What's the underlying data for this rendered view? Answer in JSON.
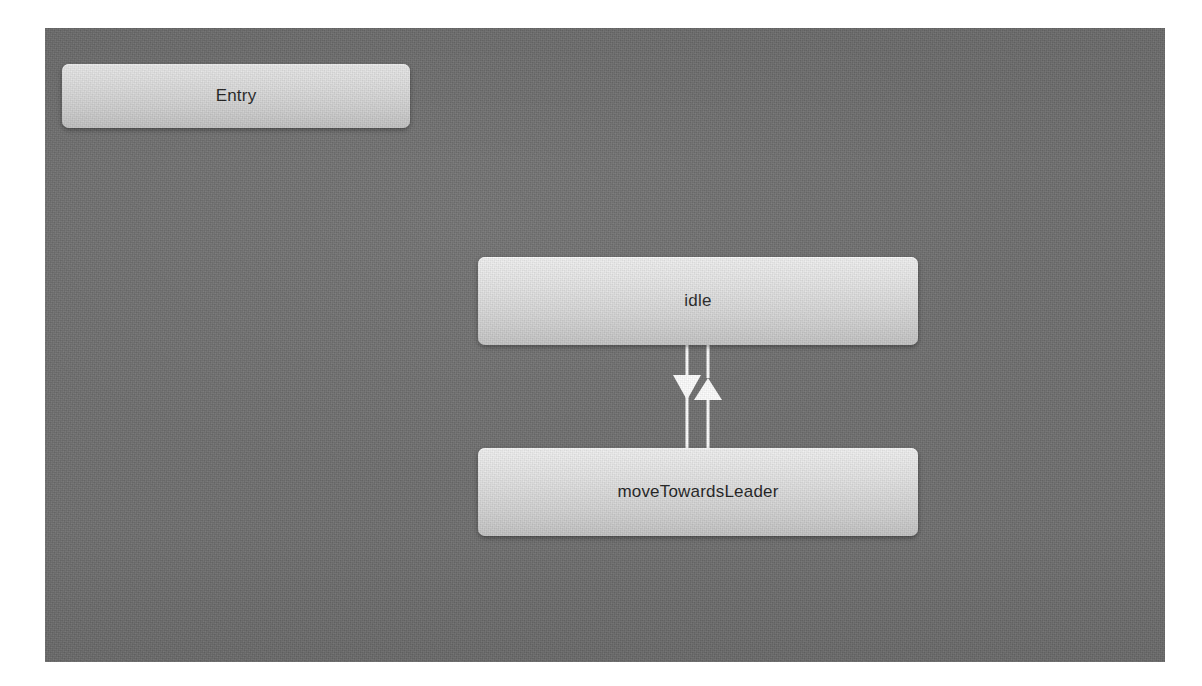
{
  "editor": {
    "canvas_name": "state-machine-canvas",
    "background_color": "#6e6e6e",
    "node_fill_top_color": "#f1f1f1",
    "node_fill_bottom_color": "#c3c3c3",
    "node_text_color": "#1d1d1d",
    "transition_color": "#ffffff"
  },
  "states": [
    {
      "id": "entry",
      "label": "Entry",
      "x": 62,
      "y": 64,
      "width": 348,
      "height": 64
    },
    {
      "id": "idle",
      "label": "idle",
      "x": 478,
      "y": 257,
      "width": 440,
      "height": 88
    },
    {
      "id": "moveTowardsLeader",
      "label": "moveTowardsLeader",
      "x": 478,
      "y": 448,
      "width": 440,
      "height": 88
    }
  ],
  "transitions": [
    {
      "id": "idle-to-movetowardsleader",
      "from": "idle",
      "to": "moveTowardsLeader",
      "direction": "down",
      "label": ""
    },
    {
      "id": "movetowardsleader-to-idle",
      "from": "moveTowardsLeader",
      "to": "idle",
      "direction": "up",
      "label": ""
    }
  ]
}
